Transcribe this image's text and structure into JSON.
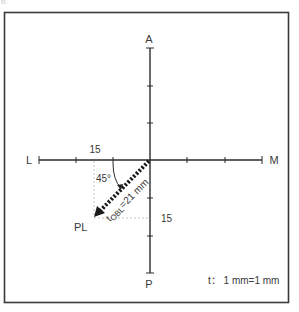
{
  "figure": {
    "label": "b.",
    "axes": {
      "top": "A",
      "bottom": "P",
      "left": "L",
      "right": "M",
      "ticks_per_half_axis": 3
    },
    "measurements": {
      "horizontal_component": "15",
      "vertical_component": "15",
      "angle": "45°",
      "result_label": "PL",
      "vector_label_main": "t",
      "vector_label_sub": "OBL",
      "vector_label_value": "=21 mm"
    },
    "scale": {
      "label": "t： 1 mm=1 mm"
    },
    "colors": {
      "axis": "#2b2b2b",
      "frame": "#3a3a3a",
      "guide": "#bdbdbd",
      "text": "#3a3a3a"
    }
  }
}
